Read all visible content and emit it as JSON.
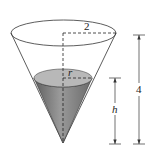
{
  "diagram": {
    "type": "conical-tank",
    "labels": {
      "top_radius": "2",
      "water_radius": "r",
      "total_height": "4",
      "water_height": "h"
    },
    "colors": {
      "water_fill": "#8a8a8a",
      "water_surface": "#b5b5b5",
      "outline": "#333333",
      "background": "#ffffff"
    }
  }
}
